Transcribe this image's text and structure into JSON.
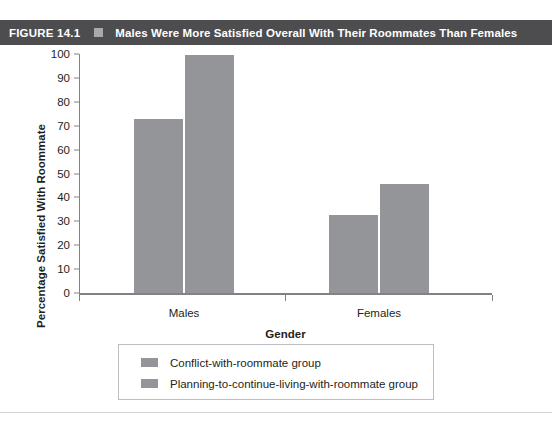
{
  "figure": {
    "number": "FIGURE 14.1",
    "separator_icon": "square-bullet-icon",
    "title": "Males Were More Satisfied Overall With Their Roommates Than Females",
    "bar_color": "#4d4d4f",
    "text_color": "#ffffff"
  },
  "chart_data": {
    "type": "bar",
    "title": "Males Were More Satisfied Overall With Their Roommates Than Females",
    "categories": [
      "Males",
      "Females"
    ],
    "series": [
      {
        "name": "Conflict-with-roommate group",
        "values": [
          73,
          32.5
        ],
        "color": "#949598"
      },
      {
        "name": "Planning-to-continue-living-with-roommate group",
        "values": [
          99.5,
          45.5
        ],
        "color": "#949598"
      }
    ],
    "xlabel": "Gender",
    "ylabel": "Percentage Satisfied With Roommate",
    "ylim": [
      0,
      100
    ],
    "yticks": [
      0,
      10,
      20,
      30,
      40,
      50,
      60,
      70,
      80,
      90,
      100
    ],
    "ytick_labels": [
      "0",
      "10",
      "20",
      "30",
      "40",
      "50",
      "60",
      "70",
      "80",
      "90",
      "100"
    ],
    "grid": false,
    "legend_position": "bottom-center"
  }
}
